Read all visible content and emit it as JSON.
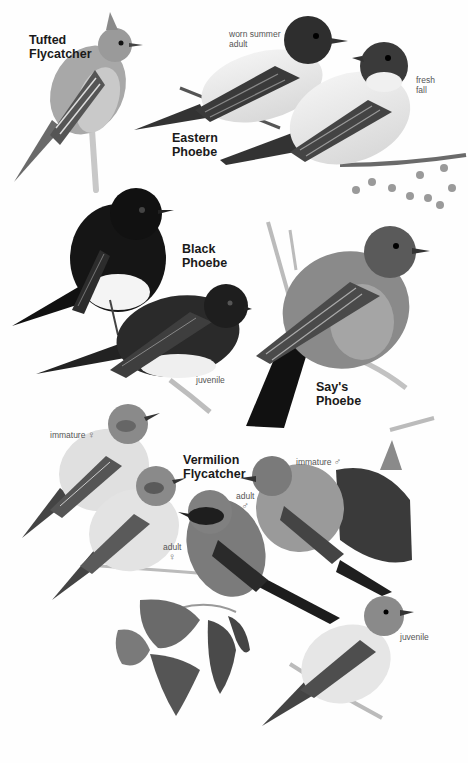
{
  "plate": {
    "species": [
      {
        "name_line1": "Tufted",
        "name_line2": "Flycatcher"
      },
      {
        "name_line1": "Eastern",
        "name_line2": "Phoebe"
      },
      {
        "name_line1": "Black",
        "name_line2": "Phoebe"
      },
      {
        "name_line1": "Say's",
        "name_line2": "Phoebe"
      },
      {
        "name_line1": "Vermilion",
        "name_line2": "Flycatcher"
      }
    ],
    "labels": {
      "eastern_worn_line1": "worn summer",
      "eastern_worn_line2": "adult",
      "eastern_fresh_line1": "fresh",
      "eastern_fresh_line2": "fall",
      "black_juvenile": "juvenile",
      "vermilion_immature_female": "immature",
      "vermilion_immature_female_sym": "♀",
      "vermilion_immature_male": "immature",
      "vermilion_immature_male_sym": "♂",
      "vermilion_adult_male": "adult",
      "vermilion_adult_male_sym": "♂",
      "vermilion_adult_female": "adult",
      "vermilion_adult_female_sym": "♀",
      "vermilion_juvenile": "juvenile"
    }
  }
}
